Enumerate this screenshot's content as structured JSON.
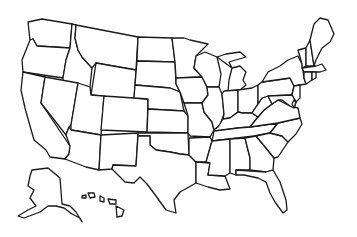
{
  "map": {
    "type": "blank-outline",
    "subject": "United States states outline",
    "line_color": "#1a1a1a",
    "fill_color": "#ffffff",
    "background": "#ffffff",
    "labels": [],
    "states": [
      {
        "id": "WA",
        "d": "M28,22 L42,19 L72,24 L70,48 L37,46 L33,39 L30,40 Z"
      },
      {
        "id": "OR",
        "d": "M30,40 L33,39 L37,46 L70,48 L66,60 L63,78 L23,72 L22,60 Z"
      },
      {
        "id": "CA",
        "d": "M23,72 L45,77 L41,103 L70,146 L69,154 L65,159 L50,157 L46,150 L34,140 L30,126 L25,108 L21,90 Z"
      },
      {
        "id": "ID",
        "d": "M72,24 L76,25 L75,38 L78,50 L82,57 L92,68 L90,87 L63,82 L63,78 L66,60 L70,48 Z"
      },
      {
        "id": "NV",
        "d": "M45,77 L78,83 L71,125 L69,127 L66,135 L41,103 Z"
      },
      {
        "id": "MT",
        "d": "M76,25 L138,37 L136,70 L96,63 L92,68 L82,57 L78,50 L75,38 Z"
      },
      {
        "id": "WY",
        "d": "M96,63 L136,70 L134,100 L91,95 Z"
      },
      {
        "id": "UT",
        "d": "M78,83 L90,87 L91,95 L104,96 L101,135 L71,130 L71,125 Z"
      },
      {
        "id": "AZ",
        "d": "M71,130 L101,135 L99,170 L86,167 L65,159 L69,154 L70,146 L66,135 L69,127 Z"
      },
      {
        "id": "CO",
        "d": "M104,96 L148,99 L147,132 L101,130 Z"
      },
      {
        "id": "NM",
        "d": "M101,135 L138,133 L136,166 L113,165 L112,169 L99,170 Z"
      },
      {
        "id": "ND",
        "d": "M138,37 L172,38 L175,62 L137,61 Z"
      },
      {
        "id": "SD",
        "d": "M137,61 L175,62 L176,84 L180,92 L170,88 L135,85 Z"
      },
      {
        "id": "NE",
        "d": "M135,85 L170,88 L180,92 L184,111 L148,109 L148,99 L134,98 Z"
      },
      {
        "id": "KS",
        "d": "M148,109 L184,111 L188,116 L188,133 L147,132 Z"
      },
      {
        "id": "OK",
        "d": "M138,133 L188,133 L189,155 L180,154 L170,152 L156,150 L150,145 L150,136 L138,136 Z"
      },
      {
        "id": "TX",
        "d": "M138,136 L150,136 L150,145 L156,150 L170,152 L180,154 L189,155 L196,162 L196,183 L180,192 L174,200 L176,213 L166,210 L156,196 L147,184 L140,177 L134,183 L125,182 L115,172 L112,169 L113,165 L136,166 Z"
      },
      {
        "id": "MN",
        "d": "M172,38 L184,38 L190,40 L208,44 L196,56 L194,68 L202,77 L176,78 L175,62 Z"
      },
      {
        "id": "IA",
        "d": "M176,78 L202,77 L207,87 L208,95 L202,103 L184,103 L180,92 L176,84 Z"
      },
      {
        "id": "MO",
        "d": "M184,103 L202,103 L204,112 L212,122 L214,130 L210,137 L190,136 L188,133 L188,116 Z"
      },
      {
        "id": "AR",
        "d": "M189,138 L210,137 L212,141 L208,155 L206,162 L196,162 L189,155 Z"
      },
      {
        "id": "LA",
        "d": "M196,162 L210,163 L208,175 L225,176 L230,189 L220,190 L208,187 L196,183 Z"
      },
      {
        "id": "WI",
        "d": "M196,56 L205,52 L217,57 L221,74 L219,87 L207,87 L202,77 L194,68 Z"
      },
      {
        "id": "IL",
        "d": "M207,87 L219,87 L222,94 L224,114 L220,125 L214,130 L212,122 L204,112 L202,103 L208,95 Z"
      },
      {
        "id": "MI",
        "d": "M217,57 L226,54 L240,52 L246,57 L229,62 L232,68 Z M232,68 L240,66 L246,72 L243,80 L246,85 L240,90 L228,91 L229,80 Z"
      },
      {
        "id": "IN",
        "d": "M224,91 L238,90 L238,112 L230,118 L223,119 L224,114 L222,94 Z"
      },
      {
        "id": "OH",
        "d": "M238,90 L252,88 L258,85 L258,104 L252,113 L242,113 L238,112 Z"
      },
      {
        "id": "KY",
        "d": "M214,130 L218,127 L223,119 L230,118 L238,112 L242,113 L252,113 L258,117 L250,127 L238,128 L217,131 Z"
      },
      {
        "id": "TN",
        "d": "M214,131 L238,128 L250,127 L278,123 L270,133 L254,136 L212,141 Z"
      },
      {
        "id": "MS",
        "d": "M212,141 L230,139 L230,173 L225,176 L208,175 L210,163 L206,162 L208,155 Z"
      },
      {
        "id": "AL",
        "d": "M230,139 L245,138 L250,158 L250,170 L236,170 L236,175 L230,173 Z"
      },
      {
        "id": "GA",
        "d": "M245,138 L256,136 L266,148 L274,158 L273,170 L266,172 L250,170 L250,158 Z"
      },
      {
        "id": "FL",
        "d": "M236,170 L266,172 L273,170 L280,182 L286,200 L287,210 L283,213 L275,202 L270,193 L266,182 L258,178 L244,175 L236,175 Z"
      },
      {
        "id": "SC",
        "d": "M256,136 L270,133 L282,136 L288,142 L278,157 L274,158 L266,148 Z"
      },
      {
        "id": "NC",
        "d": "M270,133 L278,123 L300,118 L302,124 L296,134 L288,142 L282,136 Z"
      },
      {
        "id": "VA",
        "d": "M250,127 L258,117 L264,110 L272,104 L278,100 L290,106 L298,108 L300,118 L278,123 Z"
      },
      {
        "id": "WV",
        "d": "M258,104 L262,98 L268,96 L272,104 L264,110 L258,117 L252,113 Z"
      },
      {
        "id": "PA",
        "d": "M258,85 L262,82 L290,78 L294,86 L292,95 L268,96 L262,98 L258,104 Z"
      },
      {
        "id": "NY",
        "d": "M262,82 L268,72 L280,66 L288,60 L298,56 L302,64 L304,78 L306,84 L300,85 L294,86 L290,78 Z"
      },
      {
        "id": "NJ",
        "d": "M294,86 L300,85 L300,98 L296,102 L292,95 Z"
      },
      {
        "id": "MD",
        "d": "M268,96 L292,95 L296,102 L294,108 L290,106 L282,100 L278,100 L272,104 Z"
      },
      {
        "id": "DE",
        "d": "M294,100 L296,102 L294,108 L292,104 Z"
      },
      {
        "id": "VT",
        "d": "M298,50 L306,48 L306,66 L302,68 L302,64 Z"
      },
      {
        "id": "NH",
        "d": "M306,48 L310,40 L314,66 L306,66 Z"
      },
      {
        "id": "ME",
        "d": "M310,40 L314,24 L320,18 L328,20 L334,34 L330,42 L322,48 L316,60 L314,66 Z"
      },
      {
        "id": "MA",
        "d": "M302,68 L316,66 L322,64 L326,70 L320,72 L316,72 L304,72 Z"
      },
      {
        "id": "CT",
        "d": "M304,72 L312,72 L312,80 L306,84 L304,78 Z"
      },
      {
        "id": "RI",
        "d": "M312,72 L316,72 L316,78 L312,80 Z"
      },
      {
        "id": "AK",
        "d": "M32,170 L48,168 L60,178 L62,204 L70,206 L76,212 L82,222 L80,218 L72,214 L64,208 L56,206 L48,206 L40,212 L24,218 L18,216 L28,210 L36,206 L30,198 L34,190 L28,186 L30,176 Z"
      },
      {
        "id": "HI-1",
        "d": "M82,196 L86,195 L86,198 L82,198 Z"
      },
      {
        "id": "HI-2",
        "d": "M88,193 L94,193 L95,197 L90,198 Z"
      },
      {
        "id": "HI-3",
        "d": "M100,196 L104,198 L104,202 L100,201 Z"
      },
      {
        "id": "HI-4",
        "d": "M108,199 L116,200 L116,204 L110,204 Z"
      },
      {
        "id": "HI-5",
        "d": "M116,206 L124,210 L122,216 L117,217 Z"
      }
    ]
  }
}
